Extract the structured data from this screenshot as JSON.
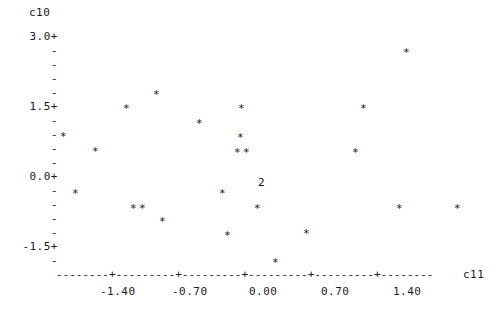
{
  "chart_data": {
    "type": "scatter",
    "title": "",
    "xlabel": "c11",
    "ylabel": "c10",
    "grid": false,
    "legend": null,
    "marker": "*",
    "overlap_marker_note": "digit shows count of coincident points",
    "xlim": [
      -1.9,
      1.9
    ],
    "ylim": [
      -1.9,
      3.2
    ],
    "xticks": [
      -1.4,
      -0.7,
      0.0,
      0.7,
      1.4
    ],
    "xtick_labels": [
      "-1.40",
      "-0.70",
      "0.00",
      "0.70",
      "1.40"
    ],
    "yticks": [
      3.0,
      1.5,
      0.0,
      -1.5
    ],
    "ytick_labels": [
      "3.0+",
      "1.5+",
      "0.0+",
      "-1.5+"
    ],
    "y_minor_tick_mark": "-",
    "y_minor_per_major": 4,
    "axis_line_char": "-",
    "axis_tick_char": "+",
    "points": [
      {
        "x": 1.21,
        "y": 2.85,
        "n": 1
      },
      {
        "x": -0.73,
        "y": 1.78,
        "n": 1
      },
      {
        "x": -1.03,
        "y": 1.5,
        "n": 1
      },
      {
        "x": 0.11,
        "y": 1.5,
        "n": 1
      },
      {
        "x": 1.3,
        "y": 1.5,
        "n": 1
      },
      {
        "x": -0.31,
        "y": 1.21,
        "n": 1
      },
      {
        "x": 0.11,
        "y": 0.93,
        "n": 1
      },
      {
        "x": 0.08,
        "y": 0.64,
        "n": 2
      },
      {
        "x": 1.22,
        "y": 0.64,
        "n": 1
      },
      {
        "x": -1.74,
        "y": 0.64,
        "n": 1
      },
      {
        "x": -1.78,
        "y": 0.9,
        "n": 1
      },
      {
        "x": -1.61,
        "y": -0.11,
        "n": 1
      },
      {
        "x": 0.09,
        "y": -0.11,
        "n": 1
      },
      {
        "x": -0.12,
        "y": -0.2,
        "n": 1
      },
      {
        "x": 0.3,
        "y": 0.08,
        "n": 2
      },
      {
        "x": -1.16,
        "y": -0.47,
        "n": 2
      },
      {
        "x": -0.94,
        "y": -0.7,
        "n": 1
      },
      {
        "x": 0.04,
        "y": -0.47,
        "n": 1
      },
      {
        "x": 1.41,
        "y": -0.47,
        "n": 1
      },
      {
        "x": 1.97,
        "y": -0.47,
        "n": 1
      },
      {
        "x": -0.47,
        "y": -1.0,
        "n": 1
      },
      {
        "x": 0.48,
        "y": -1.0,
        "n": 1
      },
      {
        "x": 0.02,
        "y": -1.35,
        "n": 1
      }
    ],
    "marker_positions_px": [
      {
        "px": 403,
        "py": 47,
        "glyph": "*"
      },
      {
        "px": 153,
        "py": 89,
        "glyph": "*"
      },
      {
        "px": 123,
        "py": 103,
        "glyph": "*"
      },
      {
        "px": 238,
        "py": 103,
        "glyph": "*"
      },
      {
        "px": 360,
        "py": 103,
        "glyph": "*"
      },
      {
        "px": 196,
        "py": 118,
        "glyph": "*"
      },
      {
        "px": 237,
        "py": 132,
        "glyph": "*"
      },
      {
        "px": 60,
        "py": 131,
        "glyph": "*"
      },
      {
        "px": 92,
        "py": 146,
        "glyph": "*"
      },
      {
        "px": 234,
        "py": 147,
        "glyph": "*"
      },
      {
        "px": 243,
        "py": 147,
        "glyph": "*"
      },
      {
        "px": 352,
        "py": 147,
        "glyph": "*"
      },
      {
        "px": 72,
        "py": 188,
        "glyph": "*"
      },
      {
        "px": 219,
        "py": 188,
        "glyph": "*"
      },
      {
        "px": 258,
        "py": 177,
        "glyph": "2"
      },
      {
        "px": 254,
        "py": 203,
        "glyph": "*"
      },
      {
        "px": 130,
        "py": 203,
        "glyph": "*"
      },
      {
        "px": 139,
        "py": 203,
        "glyph": "*"
      },
      {
        "px": 396,
        "py": 203,
        "glyph": "*"
      },
      {
        "px": 454,
        "py": 203,
        "glyph": "*"
      },
      {
        "px": 159,
        "py": 216,
        "glyph": "*"
      },
      {
        "px": 224,
        "py": 230,
        "glyph": "*"
      },
      {
        "px": 303,
        "py": 228,
        "glyph": "*"
      },
      {
        "px": 272,
        "py": 257,
        "glyph": "*"
      }
    ]
  },
  "axes": {
    "y_title": "c10",
    "x_title": "c11",
    "y_major_labels": [
      "3.0+",
      "1.5+",
      "0.0+",
      "-1.5+"
    ],
    "y_minor_label": "-",
    "x_tick_labels": [
      "-1.40",
      "-0.70",
      "0.00",
      "0.70",
      "1.40"
    ],
    "x_axis_line": "--------+---------+---------+---------+---------+--------"
  }
}
